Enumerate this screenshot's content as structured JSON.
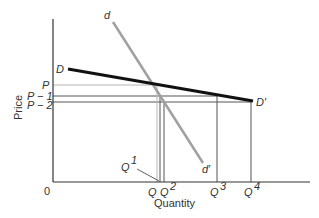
{
  "diagram": {
    "x_axis_label": "Quantity",
    "y_axis_label": "Price",
    "origin_label": "0",
    "price_labels": {
      "p": "P",
      "p1": "P − 1",
      "p2": "P − 2"
    },
    "quantity_labels": {
      "q": "Q",
      "q1": "Q",
      "q1_sup": "1",
      "q2": "Q",
      "q2_sup": "2",
      "q3": "Q",
      "q3_sup": "3",
      "q4": "Q",
      "q4_sup": "4"
    },
    "curves": {
      "elastic_demand": {
        "start_label": "D",
        "end_label": "D′",
        "color": "#111111"
      },
      "inelastic_demand": {
        "start_label": "d",
        "end_label": "d′",
        "color": "#a0a0a0"
      }
    }
  }
}
